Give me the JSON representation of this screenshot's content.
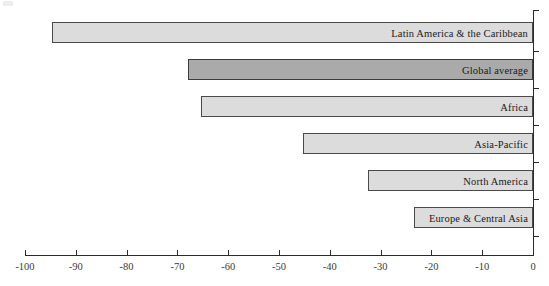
{
  "chart_data": {
    "type": "bar",
    "orientation": "horizontal",
    "title": "",
    "subtitle": "",
    "xlabel": "",
    "ylabel": "",
    "xlim": [
      -100,
      0
    ],
    "ylim": null,
    "grid": false,
    "legend": null,
    "axis_ticks": [
      "-100",
      "-90",
      "-80",
      "-70",
      "-60",
      "-50",
      "-40",
      "-30",
      "-20",
      "-10",
      "0"
    ],
    "axis_tick_values": [
      -100,
      -90,
      -80,
      -70,
      -60,
      -50,
      -40,
      -30,
      -20,
      -10,
      0
    ],
    "categories": [
      "Latin America & the Caribbean",
      "Global average",
      "Africa",
      "Asia-Pacific",
      "North America",
      "Europe & Central Asia"
    ],
    "values": [
      -94.7,
      -68.0,
      -65.4,
      -45.3,
      -32.5,
      -23.4
    ],
    "series": [
      {
        "name": "Change",
        "values": [
          -94.7,
          -68.0,
          -65.4,
          -45.3,
          -32.5,
          -23.4
        ]
      }
    ],
    "bar_colors": [
      "#dcdcdc",
      "#aaaaaa",
      "#dcdcdc",
      "#dcdcdc",
      "#dcdcdc",
      "#dcdcdc"
    ],
    "highlighted_category": "Global average",
    "annotations": []
  },
  "colors": {
    "bar_fill": "#dcdcdc",
    "bar_fill_highlight": "#aaaaaa",
    "bar_stroke": "#4a4a4a",
    "axis": "#2b2b2b",
    "text": "#1a1a1a",
    "tick_text": "#3a3a3a",
    "background": "#ffffff"
  }
}
